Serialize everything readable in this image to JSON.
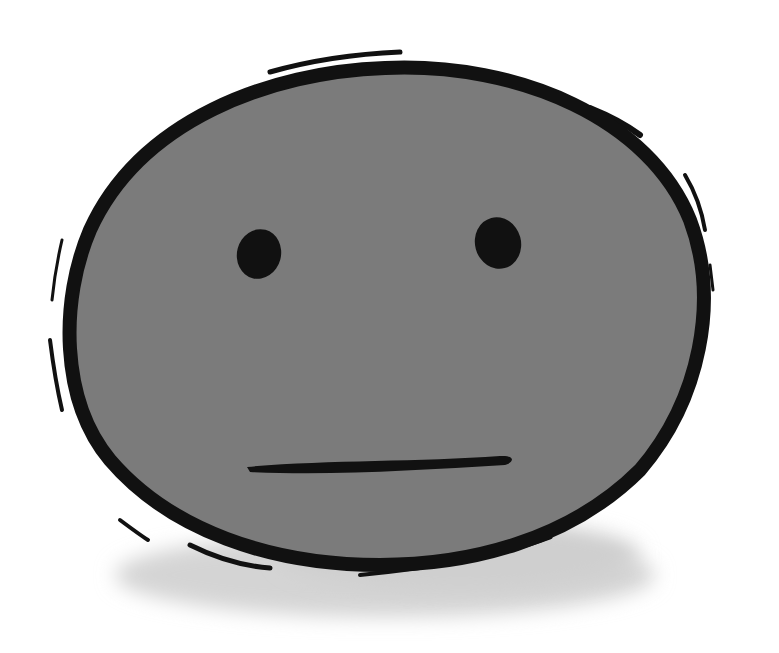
{
  "illustration": {
    "subject": "neutral-face",
    "alt": "Hand-drawn gray face with a flat neutral expression",
    "colors": {
      "background": "#ffffff",
      "face_fill": "#7b7b7b",
      "outline": "#111111",
      "shadow": "#d4d4d4"
    }
  }
}
